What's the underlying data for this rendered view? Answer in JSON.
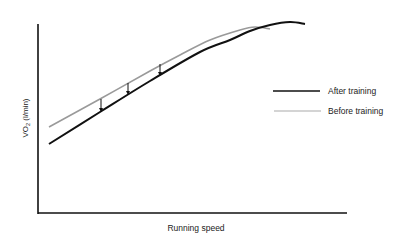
{
  "chart_data": {
    "type": "line",
    "title": "",
    "xlabel": "Running speed",
    "ylabel": "VO2 (l/min)",
    "ylabel_main": "VO",
    "ylabel_sub": "2",
    "ylabel_unit": " (l/min)",
    "grid": false,
    "legend_position": "right-middle",
    "series": [
      {
        "name": "After training",
        "color": "#111111",
        "description": "Lower linear rise, curving to a plateau at higher peak",
        "points_px": [
          [
            49,
            144
          ],
          [
            100,
            112
          ],
          [
            150,
            81
          ],
          [
            200,
            52
          ],
          [
            230,
            40
          ],
          [
            250,
            31
          ],
          [
            270,
            25
          ],
          [
            290,
            22
          ],
          [
            305,
            24
          ]
        ]
      },
      {
        "name": "Before training",
        "color": "#9a9a9a",
        "description": "Higher linear rise, plateauing earlier and lower",
        "points_px": [
          [
            49,
            127
          ],
          [
            100,
            99
          ],
          [
            150,
            71
          ],
          [
            180,
            55
          ],
          [
            210,
            40
          ],
          [
            240,
            30
          ],
          [
            255,
            27
          ],
          [
            270,
            29
          ]
        ]
      }
    ],
    "annotations": [
      {
        "type": "arrow-down",
        "x": 101,
        "y1": 99,
        "y2": 112
      },
      {
        "type": "arrow-down",
        "x": 128,
        "y1": 83,
        "y2": 95
      },
      {
        "type": "arrow-down",
        "x": 160,
        "y1": 64,
        "y2": 76
      }
    ]
  },
  "legend": {
    "items": [
      {
        "label": "After training",
        "color": "#111111"
      },
      {
        "label": "Before training",
        "color": "#9a9a9a"
      }
    ]
  }
}
